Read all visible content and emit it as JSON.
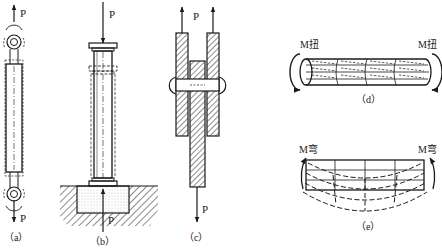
{
  "figure": {
    "panels": [
      {
        "id": "a",
        "caption": "（a）",
        "type": "tension",
        "load_top": "P",
        "load_bottom": "P"
      },
      {
        "id": "b",
        "caption": "（b）",
        "type": "compression",
        "load_top": "P",
        "load_bottom": "P"
      },
      {
        "id": "c",
        "caption": "（c）",
        "type": "shear",
        "load_top": "P",
        "load_bottom": "P"
      },
      {
        "id": "d",
        "caption": "（d）",
        "type": "torsion",
        "moment_left": "M扭",
        "moment_right": "M扭"
      },
      {
        "id": "e",
        "caption": "（e）",
        "type": "bending",
        "moment_left": "M弯",
        "moment_right": "M弯"
      }
    ]
  },
  "colors": {
    "line": "#1a1a1a",
    "background": "#ffffff",
    "fill_dots": "#e8e8e8"
  }
}
